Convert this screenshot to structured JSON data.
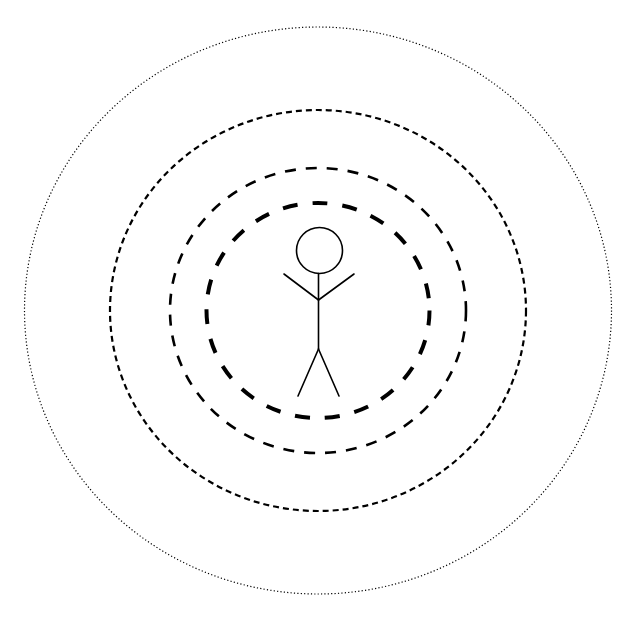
{
  "diagram": {
    "type": "concentric-zones",
    "canvas": {
      "width": 635,
      "height": 622,
      "background": "#ffffff"
    },
    "stroke_color": "#000000",
    "center": {
      "x": 318,
      "y": 310.5
    },
    "rings": [
      {
        "name": "outer-ring",
        "rx": 293.5,
        "ry": 283.5,
        "stroke_width": 1.2,
        "dash": "1.2 2.2",
        "style": "dotted"
      },
      {
        "name": "ring-3",
        "rx": 208,
        "ry": 200.5,
        "stroke_width": 2.2,
        "dash": "6 4",
        "style": "short-dashed"
      },
      {
        "name": "ring-2",
        "rx": 148,
        "ry": 142.5,
        "stroke_width": 2.6,
        "dash": "11 10",
        "style": "medium-dashed"
      },
      {
        "name": "inner-ring",
        "rx": 111.5,
        "ry": 107.5,
        "stroke_width": 4,
        "dash": "15 15",
        "style": "long-dashed-bold"
      }
    ],
    "figure": {
      "head": {
        "cx": 319.5,
        "cy": 250.5,
        "r": 23
      },
      "neck_top": {
        "x": 318.5,
        "y": 273.5
      },
      "shoulder": {
        "x": 318.5,
        "y": 300
      },
      "left_hand": {
        "x": 284,
        "y": 274
      },
      "right_hand": {
        "x": 354,
        "y": 274
      },
      "hip": {
        "x": 318.5,
        "y": 349
      },
      "left_foot": {
        "x": 298,
        "y": 396
      },
      "right_foot": {
        "x": 339,
        "y": 396
      },
      "stroke_width": 1.6
    }
  }
}
